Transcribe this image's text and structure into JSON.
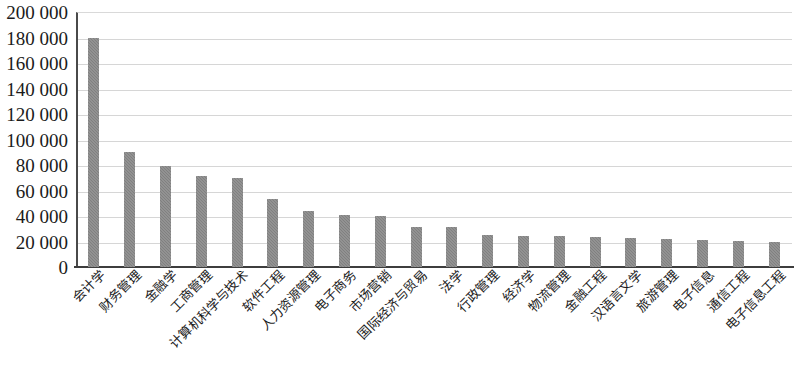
{
  "chart_data": {
    "type": "bar",
    "title": "",
    "subtitle": "",
    "xlabel": "",
    "ylabel": "",
    "ylim": [
      0,
      200000
    ],
    "ytick_values": [
      0,
      20000,
      40000,
      60000,
      80000,
      100000,
      120000,
      140000,
      160000,
      180000,
      200000
    ],
    "ytick_labels": [
      "0",
      "20 000",
      "40 000",
      "60 000",
      "80 000",
      "100 000",
      "120 000",
      "140 000",
      "160 000",
      "180 000",
      "200 000"
    ],
    "grid": true,
    "legend": null,
    "bar_color": "#808080",
    "gridline_color": "#d6d6d6",
    "axis_color": "#3d3d3d",
    "categories": [
      "会计学",
      "财务管理",
      "金融学",
      "工商管理",
      "计算机科学与技术",
      "软件工程",
      "人力资源管理",
      "电子商务",
      "市场营销",
      "国际经济与贸易",
      "法学",
      "行政管理",
      "经济学",
      "物流管理",
      "金融工程",
      "汉语言文学",
      "旅游管理",
      "电子信息",
      "通信工程",
      "电子信息工程"
    ],
    "values": [
      180000,
      90000,
      79000,
      71000,
      70000,
      53000,
      44000,
      41000,
      40000,
      31000,
      31000,
      25000,
      24500,
      24000,
      23500,
      23000,
      22000,
      21000,
      20500,
      20000
    ]
  }
}
